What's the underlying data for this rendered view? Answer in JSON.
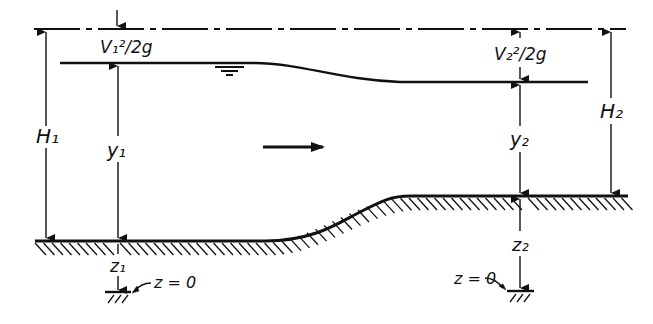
{
  "diagram": {
    "colors": {
      "ink": "#111111",
      "background": "#ffffff"
    },
    "labels": {
      "velocity_head_1": "V₁²/2g",
      "velocity_head_2": "V₂²/2g",
      "total_head_1": "H₁",
      "total_head_2": "H₂",
      "depth_1": "y₁",
      "depth_2": "y₂",
      "elevation_1": "z₁",
      "elevation_2": "z₂",
      "datum_1": "z = 0",
      "datum_2": "z = 0"
    },
    "elements": {
      "energy_line": "dashed horizontal energy grade line",
      "water_surface": "free surface falling from section 1 to section 2",
      "channel_bed": "hatched channel bed rising from section 1 to section 2",
      "flow_direction": "arrow pointing right",
      "water_surface_symbol": "inverted triangle water-level marker"
    }
  }
}
